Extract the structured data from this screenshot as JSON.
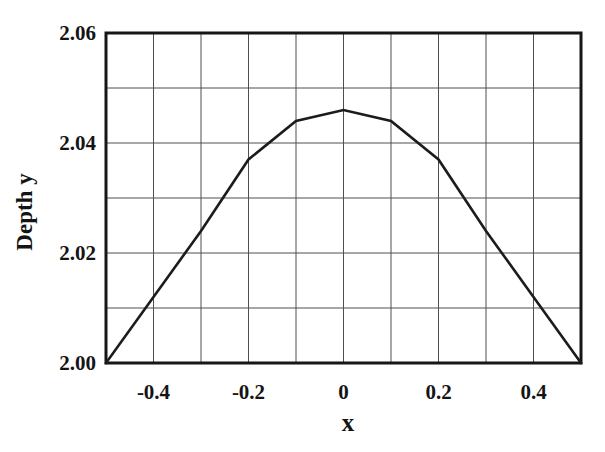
{
  "chart_data": {
    "type": "line",
    "title": "",
    "xlabel": "x",
    "ylabel": "Depth y",
    "xlim": [
      -0.5,
      0.5
    ],
    "ylim": [
      2.0,
      2.06
    ],
    "grid": true,
    "legend": false,
    "x": [
      -0.5,
      -0.4,
      -0.3,
      -0.2,
      -0.1,
      0,
      0.1,
      0.2,
      0.3,
      0.4,
      0.5
    ],
    "y": [
      2.0,
      2.012,
      2.024,
      2.037,
      2.044,
      2.046,
      2.044,
      2.037,
      2.024,
      2.012,
      2.0
    ],
    "x_ticks": {
      "values": [
        -0.4,
        -0.2,
        0,
        0.2,
        0.4
      ],
      "labels": [
        "-0.4",
        "-0.2",
        "0",
        "0.2",
        "0.4"
      ]
    },
    "y_ticks": {
      "values": [
        2.0,
        2.02,
        2.04,
        2.06
      ],
      "labels": [
        "2.00",
        "2.02",
        "2.04",
        "2.06"
      ]
    },
    "x_gridlines": [
      -0.4,
      -0.3,
      -0.2,
      -0.1,
      0,
      0.1,
      0.2,
      0.3,
      0.4
    ],
    "y_gridlines": [
      2.01,
      2.02,
      2.03,
      2.04,
      2.05
    ],
    "colors": {
      "line": "#1c1c1c",
      "grid": "#4f4f4f",
      "border": "#161616",
      "text": "#141414",
      "background": "#ffffff"
    }
  }
}
